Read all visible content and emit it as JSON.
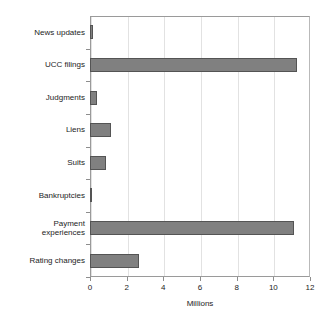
{
  "chart_data": {
    "type": "bar",
    "orientation": "horizontal",
    "title": "",
    "xlabel": "Millions",
    "ylabel": "",
    "xlim": [
      0,
      12
    ],
    "ylim": null,
    "xticks": [
      "0",
      "2",
      "4",
      "6",
      "8",
      "10",
      "12"
    ],
    "xtick_values": [
      0,
      2,
      4,
      6,
      8,
      10,
      12
    ],
    "grid": "vertical",
    "legend": "none",
    "categories": [
      "News updates",
      "UCC filings",
      "Judgments",
      "Liens",
      "Suits",
      "Bankruptcies",
      "Payment\nexperiences",
      "Rating changes"
    ],
    "values": [
      0.15,
      11.3,
      0.4,
      1.15,
      0.85,
      0.08,
      11.1,
      2.65
    ],
    "series": [
      {
        "name": "Counts",
        "values": [
          0.15,
          11.3,
          0.4,
          1.15,
          0.85,
          0.08,
          11.1,
          2.65
        ]
      }
    ],
    "colors": {
      "bar_fill": "#808080",
      "bar_edge": "#545454",
      "grid": "#e2e2e2",
      "axis": "#8d8d8d",
      "text": "#1c1c1c",
      "background": "#ffffff"
    }
  }
}
